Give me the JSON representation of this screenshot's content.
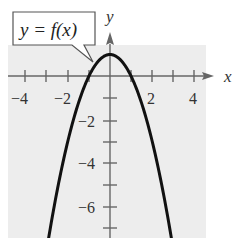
{
  "chart_data": {
    "type": "line",
    "title": "",
    "annotation": "y = f(x)",
    "xlabel": "x",
    "ylabel": "y",
    "xlim": [
      -4.5,
      4.5
    ],
    "ylim": [
      -7.5,
      1.5
    ],
    "x_ticks": [
      -4,
      -3,
      -2,
      -1,
      0,
      1,
      2,
      3,
      4
    ],
    "x_tick_labels": [
      "-4",
      "-2",
      "2",
      "4"
    ],
    "y_ticks": [
      -7,
      -6,
      -5,
      -4,
      -3,
      -2,
      -1
    ],
    "y_tick_labels": [
      "-2",
      "-4",
      "-6"
    ],
    "grid": false,
    "series": [
      {
        "name": "f(x)",
        "function": "1 - x^2",
        "x": [
          -2.9,
          -2.5,
          -2,
          -1.5,
          -1,
          -0.5,
          0,
          0.5,
          1,
          1.5,
          2,
          2.5,
          2.9
        ],
        "values": [
          -7.41,
          -5.25,
          -3,
          -1.25,
          0,
          0.75,
          1,
          0.75,
          0,
          -1.25,
          -3,
          -5.25,
          -7.41
        ]
      }
    ]
  },
  "labels": {
    "callout": "y = f(x)",
    "x_axis": "x",
    "y_axis": "y",
    "x_ticks": {
      "m4": "−4",
      "m2": "−2",
      "p2": "2",
      "p4": "4"
    },
    "y_ticks": {
      "m2": "−2",
      "m4": "−4",
      "m6": "−6"
    }
  },
  "colors": {
    "plot_background": "#ededed",
    "curve": "#111111",
    "axis": "#666666"
  }
}
